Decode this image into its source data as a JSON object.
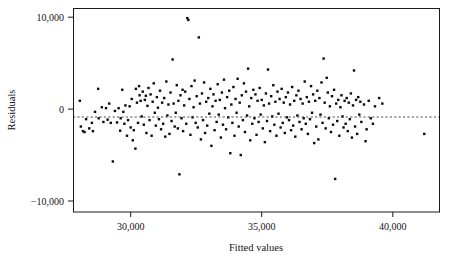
{
  "chart_data": {
    "type": "scatter",
    "title": "",
    "xlabel": "Fitted values",
    "ylabel": "Residuals",
    "xlim": [
      27800,
      41800
    ],
    "ylim": [
      -11200,
      11000
    ],
    "grid": false,
    "legend": "none",
    "reference_line": {
      "orientation": "horizontal",
      "y": 0,
      "style": "dashed"
    },
    "xticks": [
      30000,
      35000,
      40000
    ],
    "xticklabels": [
      "30,000",
      "35,000",
      "40,000"
    ],
    "yticks": [
      10000,
      0,
      -10000
    ],
    "yticklabels": [
      "10,000",
      "0",
      "−10,000"
    ],
    "marker": {
      "shape": "square",
      "color": "#0b0b0b",
      "size": 2.4
    },
    "n_points": 253,
    "points": [
      [
        28060,
        900
      ],
      [
        28100,
        -1900
      ],
      [
        28180,
        -2400
      ],
      [
        28240,
        -2500
      ],
      [
        28300,
        -1100
      ],
      [
        28420,
        -2100
      ],
      [
        28520,
        -1500
      ],
      [
        28560,
        -2400
      ],
      [
        28640,
        -300
      ],
      [
        28760,
        2200
      ],
      [
        28780,
        -1000
      ],
      [
        28900,
        200
      ],
      [
        28960,
        -1400
      ],
      [
        29060,
        100
      ],
      [
        29120,
        -1150
      ],
      [
        29180,
        600
      ],
      [
        29240,
        -1500
      ],
      [
        29320,
        -5700
      ],
      [
        29400,
        -200
      ],
      [
        29480,
        -1450
      ],
      [
        29540,
        100
      ],
      [
        29600,
        -2350
      ],
      [
        29620,
        -1000
      ],
      [
        29680,
        2100
      ],
      [
        29720,
        -300
      ],
      [
        29760,
        -1600
      ],
      [
        29800,
        400
      ],
      [
        29860,
        -2900
      ],
      [
        29900,
        -1200
      ],
      [
        29960,
        300
      ],
      [
        30000,
        -2000
      ],
      [
        30040,
        1100
      ],
      [
        30080,
        -3400
      ],
      [
        30120,
        -2300
      ],
      [
        30180,
        -4300
      ],
      [
        30200,
        2200
      ],
      [
        30240,
        700
      ],
      [
        30280,
        -1500
      ],
      [
        30320,
        2500
      ],
      [
        30340,
        1500
      ],
      [
        30380,
        900
      ],
      [
        30420,
        -800
      ],
      [
        30460,
        1900
      ],
      [
        30500,
        -1700
      ],
      [
        30540,
        1000
      ],
      [
        30580,
        1450
      ],
      [
        30600,
        -2600
      ],
      [
        30640,
        350
      ],
      [
        30680,
        2300
      ],
      [
        30720,
        -1200
      ],
      [
        30760,
        1600
      ],
      [
        30800,
        -2900
      ],
      [
        30840,
        800
      ],
      [
        30880,
        2800
      ],
      [
        30920,
        -400
      ],
      [
        30960,
        -1800
      ],
      [
        31000,
        1300
      ],
      [
        31040,
        150
      ],
      [
        31080,
        -1100
      ],
      [
        31120,
        2000
      ],
      [
        31160,
        -2200
      ],
      [
        31200,
        700
      ],
      [
        31240,
        -1600
      ],
      [
        31280,
        1200
      ],
      [
        31320,
        -3000
      ],
      [
        31360,
        3000
      ],
      [
        31400,
        -700
      ],
      [
        31440,
        500
      ],
      [
        31480,
        -2700
      ],
      [
        31520,
        1800
      ],
      [
        31560,
        -1300
      ],
      [
        31600,
        5400
      ],
      [
        31640,
        600
      ],
      [
        31680,
        -1900
      ],
      [
        31720,
        -400
      ],
      [
        31760,
        2600
      ],
      [
        31800,
        -2100
      ],
      [
        31820,
        900
      ],
      [
        31860,
        -7100
      ],
      [
        31900,
        1500
      ],
      [
        31940,
        -1000
      ],
      [
        31980,
        2100
      ],
      [
        32000,
        -2400
      ],
      [
        32040,
        400
      ],
      [
        32080,
        1900
      ],
      [
        32120,
        -1600
      ],
      [
        32160,
        9900
      ],
      [
        32200,
        9700
      ],
      [
        32240,
        1100
      ],
      [
        32280,
        -2800
      ],
      [
        32320,
        2500
      ],
      [
        32360,
        -900
      ],
      [
        32400,
        200
      ],
      [
        32440,
        3100
      ],
      [
        32480,
        -1500
      ],
      [
        32520,
        1400
      ],
      [
        32560,
        -2000
      ],
      [
        32600,
        7800
      ],
      [
        32640,
        600
      ],
      [
        32680,
        -3300
      ],
      [
        32720,
        1700
      ],
      [
        32760,
        -1200
      ],
      [
        32800,
        2900
      ],
      [
        32840,
        -2600
      ],
      [
        32880,
        800
      ],
      [
        32920,
        -1800
      ],
      [
        32960,
        1200
      ],
      [
        33000,
        -500
      ],
      [
        33040,
        2200
      ],
      [
        33080,
        -4000
      ],
      [
        33120,
        300
      ],
      [
        33160,
        1600
      ],
      [
        33200,
        -2300
      ],
      [
        33240,
        900
      ],
      [
        33280,
        -1400
      ],
      [
        33320,
        2700
      ],
      [
        33360,
        -600
      ],
      [
        33400,
        1000
      ],
      [
        33440,
        -3100
      ],
      [
        33480,
        1800
      ],
      [
        33520,
        -1700
      ],
      [
        33560,
        3200
      ],
      [
        33600,
        100
      ],
      [
        33640,
        -2200
      ],
      [
        33680,
        1300
      ],
      [
        33720,
        -900
      ],
      [
        33760,
        2000
      ],
      [
        33800,
        -4800
      ],
      [
        33840,
        500
      ],
      [
        33880,
        -1500
      ],
      [
        33920,
        2400
      ],
      [
        33960,
        -2900
      ],
      [
        34000,
        1100
      ],
      [
        34040,
        -400
      ],
      [
        34080,
        3300
      ],
      [
        34120,
        -1900
      ],
      [
        34160,
        700
      ],
      [
        34200,
        -5000
      ],
      [
        34240,
        1500
      ],
      [
        34280,
        -1200
      ],
      [
        34320,
        2800
      ],
      [
        34360,
        -2500
      ],
      [
        34400,
        1900
      ],
      [
        34440,
        -700
      ],
      [
        34480,
        4400
      ],
      [
        34520,
        300
      ],
      [
        34560,
        -3400
      ],
      [
        34600,
        1200
      ],
      [
        34640,
        -1600
      ],
      [
        34680,
        2100
      ],
      [
        34720,
        -1000
      ],
      [
        34760,
        1600
      ],
      [
        34800,
        -2800
      ],
      [
        34840,
        900
      ],
      [
        34880,
        -1400
      ],
      [
        34920,
        2300
      ],
      [
        34960,
        -600
      ],
      [
        35000,
        1000
      ],
      [
        35040,
        -2100
      ],
      [
        35080,
        400
      ],
      [
        35120,
        -3600
      ],
      [
        35160,
        1700
      ],
      [
        35200,
        -1300
      ],
      [
        35240,
        4300
      ],
      [
        35280,
        600
      ],
      [
        35320,
        -2400
      ],
      [
        35360,
        1400
      ],
      [
        35400,
        -800
      ],
      [
        35440,
        2600
      ],
      [
        35480,
        -1700
      ],
      [
        35520,
        800
      ],
      [
        35560,
        -2900
      ],
      [
        35600,
        1900
      ],
      [
        35640,
        -500
      ],
      [
        35680,
        1100
      ],
      [
        35720,
        -2000
      ],
      [
        35760,
        2200
      ],
      [
        35800,
        -1500
      ],
      [
        35840,
        700
      ],
      [
        35880,
        -2600
      ],
      [
        35920,
        1300
      ],
      [
        35960,
        -900
      ],
      [
        36000,
        1800
      ],
      [
        36040,
        -1200
      ],
      [
        36080,
        500
      ],
      [
        36120,
        -2300
      ],
      [
        36160,
        2400
      ],
      [
        36200,
        -1800
      ],
      [
        36240,
        900
      ],
      [
        36280,
        -3000
      ],
      [
        36320,
        1500
      ],
      [
        36360,
        -700
      ],
      [
        36400,
        2000
      ],
      [
        36440,
        -1400
      ],
      [
        36480,
        1100
      ],
      [
        36520,
        -2200
      ],
      [
        36560,
        600
      ],
      [
        36600,
        -1000
      ],
      [
        36640,
        3000
      ],
      [
        36680,
        -1600
      ],
      [
        36720,
        1300
      ],
      [
        36760,
        -2700
      ],
      [
        36800,
        800
      ],
      [
        36840,
        -1100
      ],
      [
        36880,
        2500
      ],
      [
        36920,
        -400
      ],
      [
        36960,
        1600
      ],
      [
        37000,
        -3700
      ],
      [
        37040,
        900
      ],
      [
        37080,
        -1900
      ],
      [
        37120,
        2000
      ],
      [
        37160,
        -3300
      ],
      [
        37200,
        1200
      ],
      [
        37240,
        -600
      ],
      [
        37280,
        2900
      ],
      [
        37320,
        -1500
      ],
      [
        37360,
        5500
      ],
      [
        37400,
        700
      ],
      [
        37440,
        -2100
      ],
      [
        37480,
        3400
      ],
      [
        37520,
        1800
      ],
      [
        37560,
        -1000
      ],
      [
        37600,
        300
      ],
      [
        37640,
        -2500
      ],
      [
        37680,
        1400
      ],
      [
        37720,
        -1700
      ],
      [
        37760,
        2100
      ],
      [
        37800,
        -7600
      ],
      [
        37840,
        600
      ],
      [
        37880,
        -1300
      ],
      [
        37920,
        1000
      ],
      [
        37960,
        -2900
      ],
      [
        38000,
        200
      ],
      [
        38040,
        1500
      ],
      [
        38080,
        -800
      ],
      [
        38120,
        -2000
      ],
      [
        38160,
        900
      ],
      [
        38200,
        -1600
      ],
      [
        38240,
        1200
      ],
      [
        38280,
        -2400
      ],
      [
        38320,
        700
      ],
      [
        38360,
        -1100
      ],
      [
        38400,
        1700
      ],
      [
        38440,
        -3100
      ],
      [
        38480,
        400
      ],
      [
        38520,
        4200
      ],
      [
        38560,
        -1900
      ],
      [
        38600,
        1000
      ],
      [
        38640,
        -2700
      ],
      [
        38680,
        1300
      ],
      [
        38720,
        -600
      ],
      [
        38760,
        800
      ],
      [
        38800,
        -1400
      ],
      [
        38900,
        500
      ],
      [
        38960,
        -3500
      ],
      [
        39000,
        -2200
      ],
      [
        39080,
        900
      ],
      [
        39160,
        -1000
      ],
      [
        39240,
        -1600
      ],
      [
        39320,
        300
      ],
      [
        39480,
        1200
      ],
      [
        39600,
        600
      ],
      [
        41200,
        -2700
      ]
    ]
  }
}
